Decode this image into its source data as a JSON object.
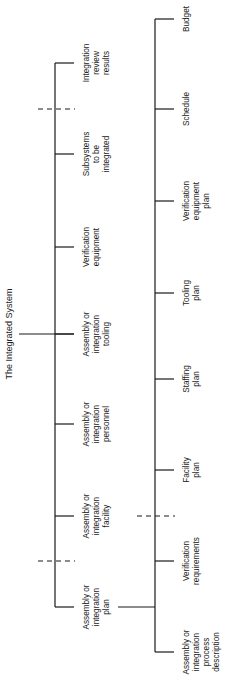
{
  "diagram": {
    "title": "The Integrated System",
    "level1": [
      {
        "lines": [
          "Integration",
          "review",
          "results"
        ]
      },
      {
        "lines": [
          "Subsystems",
          "to be",
          "integrated"
        ]
      },
      {
        "lines": [
          "Verification",
          "equipment"
        ]
      },
      {
        "lines": [
          "Assembly or",
          "integration",
          "tooling"
        ]
      },
      {
        "lines": [
          "Assembly or",
          "integration",
          "personnel"
        ]
      },
      {
        "lines": [
          "Assembly or",
          "integration",
          "facility"
        ]
      },
      {
        "lines": [
          "Assembly or",
          "integration",
          "plan"
        ]
      }
    ],
    "level2_parent": "Assembly or integration plan",
    "level2": [
      {
        "lines": [
          "Budget"
        ]
      },
      {
        "lines": [
          "Schedule"
        ]
      },
      {
        "lines": [
          "Verification",
          "equipment",
          "plan"
        ]
      },
      {
        "lines": [
          "Tooling",
          "plan"
        ]
      },
      {
        "lines": [
          "Staffing",
          "plan"
        ]
      },
      {
        "lines": [
          "Facility",
          "plan"
        ]
      },
      {
        "lines": [
          "Verification",
          "requirements"
        ]
      },
      {
        "lines": [
          "Assembly or",
          "integration",
          "process",
          "description"
        ]
      }
    ]
  }
}
